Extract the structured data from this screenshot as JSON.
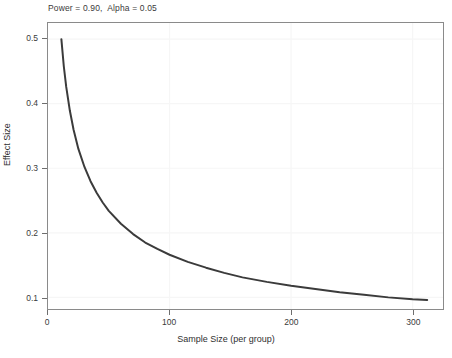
{
  "chart_data": {
    "type": "line",
    "title": "Power = 0.90,  Alpha = 0.05",
    "xlabel": "Sample Size (per group)",
    "ylabel": "Effect Size",
    "xlim": [
      0,
      325
    ],
    "ylim": [
      0.082,
      0.525
    ],
    "grid": true,
    "legend_position": "none",
    "xticks": [
      0,
      100,
      200,
      300
    ],
    "xtick_labels": [
      "0",
      "100",
      "200",
      "300"
    ],
    "yticks": [
      0.1,
      0.2,
      0.3,
      0.4,
      0.5
    ],
    "ytick_labels": [
      "0.1",
      "0.2",
      "0.3",
      "0.4",
      "0.5"
    ],
    "series": [
      {
        "name": "Detectable effect size",
        "color": "#3b3b3b",
        "line_width": 2,
        "x": [
          11,
          13,
          15,
          18,
          21,
          25,
          30,
          35,
          40,
          45,
          50,
          60,
          70,
          80,
          90,
          100,
          115,
          130,
          145,
          160,
          180,
          200,
          220,
          240,
          260,
          280,
          300,
          312
        ],
        "y": [
          0.5,
          0.458,
          0.426,
          0.389,
          0.36,
          0.33,
          0.302,
          0.28,
          0.262,
          0.247,
          0.234,
          0.214,
          0.198,
          0.185,
          0.175,
          0.166,
          0.155,
          0.146,
          0.138,
          0.131,
          0.124,
          0.118,
          0.113,
          0.108,
          0.104,
          0.1,
          0.097,
          0.096
        ]
      }
    ],
    "annotations": {
      "power": "0.90",
      "alpha": "0.05"
    }
  },
  "chart": {
    "title_text": "Power = 0.90,  Alpha = 0.05",
    "x_axis_title": "Sample Size (per group)",
    "y_axis_title": "Effect Size"
  }
}
